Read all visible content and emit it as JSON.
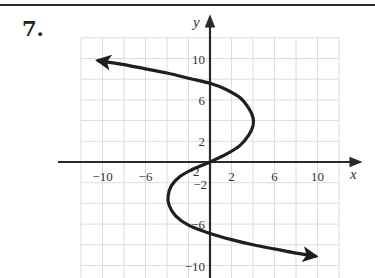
{
  "problem": {
    "number": "7."
  },
  "chart_data": {
    "type": "line",
    "title": "",
    "xlabel": "x",
    "ylabel": "y",
    "xlim": [
      -12,
      12
    ],
    "ylim": [
      -11,
      12
    ],
    "grid": true,
    "grid_step": 2,
    "x_ticks": [
      {
        "value": -10,
        "label": "−10"
      },
      {
        "value": -6,
        "label": "−6"
      },
      {
        "value": -2,
        "label": "−2"
      },
      {
        "value": 2,
        "label": "2"
      },
      {
        "value": 6,
        "label": "6"
      },
      {
        "value": 10,
        "label": "10"
      }
    ],
    "y_ticks": [
      {
        "value": 10,
        "label": "10"
      },
      {
        "value": 6,
        "label": "6"
      },
      {
        "value": 2,
        "label": "2"
      },
      {
        "value": -2,
        "label": "−2"
      },
      {
        "value": -6,
        "label": "−6"
      },
      {
        "value": -10,
        "label": "−10"
      }
    ],
    "series": [
      {
        "name": "curve",
        "description": "S-shaped curve x as cubic function of y, both ends with arrows",
        "arrow_start": true,
        "arrow_end": true,
        "points": [
          [
            -10.4,
            9.8
          ],
          [
            -8.0,
            9.4
          ],
          [
            -6.0,
            9.0
          ],
          [
            -4.0,
            8.6
          ],
          [
            -2.0,
            8.1
          ],
          [
            0.0,
            7.6
          ],
          [
            1.5,
            7.0
          ],
          [
            2.8,
            6.2
          ],
          [
            3.6,
            5.2
          ],
          [
            4.0,
            4.3
          ],
          [
            4.0,
            3.5
          ],
          [
            3.6,
            2.6
          ],
          [
            2.8,
            1.6
          ],
          [
            1.6,
            0.8
          ],
          [
            0.0,
            0.0
          ],
          [
            -1.6,
            -0.7
          ],
          [
            -2.8,
            -1.4
          ],
          [
            -3.6,
            -2.3
          ],
          [
            -3.9,
            -3.3
          ],
          [
            -3.8,
            -4.2
          ],
          [
            -3.2,
            -5.2
          ],
          [
            -2.0,
            -6.1
          ],
          [
            0.0,
            -6.9
          ],
          [
            2.0,
            -7.5
          ],
          [
            4.0,
            -8.0
          ],
          [
            6.0,
            -8.4
          ],
          [
            8.0,
            -8.8
          ],
          [
            9.8,
            -9.1
          ]
        ]
      }
    ],
    "colors": {
      "curve": "#1e1e1e",
      "axis": "#2a2a2a",
      "grid": "#dcdcdc"
    }
  }
}
